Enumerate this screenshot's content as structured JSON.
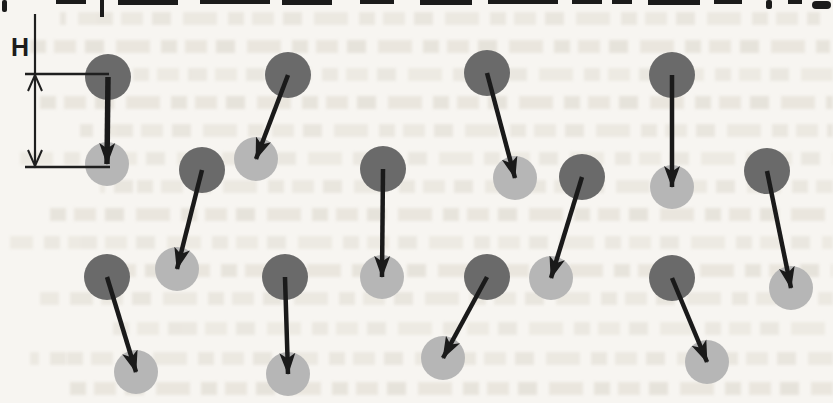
{
  "figure": {
    "label_h": "H",
    "colors": {
      "dark_particle": "#6a6a6a",
      "light_particle": "#b6b6b6",
      "arrow": "#1a1a1a",
      "line": "#1f1f1f",
      "background": "#f7f5f1"
    },
    "particle_radius_dark": 23,
    "particle_radius_light": 22,
    "dimension": {
      "x": 35,
      "line_top": 14,
      "y_top": 74,
      "y_bottom": 167,
      "tick_x1": 25,
      "tick_x2": 109
    },
    "pairs": [
      {
        "dark": [
          108,
          77
        ],
        "light": [
          107,
          164
        ],
        "thick": true
      },
      {
        "dark": [
          288,
          75
        ],
        "light": [
          256,
          159
        ]
      },
      {
        "dark": [
          487,
          73
        ],
        "light": [
          515,
          178
        ]
      },
      {
        "dark": [
          672,
          75
        ],
        "light": [
          672,
          187
        ]
      },
      {
        "dark": [
          202,
          170
        ],
        "light": [
          177,
          269
        ]
      },
      {
        "dark": [
          383,
          169
        ],
        "light": [
          382,
          277
        ]
      },
      {
        "dark": [
          582,
          177
        ],
        "light": [
          551,
          278
        ]
      },
      {
        "dark": [
          767,
          171
        ],
        "light": [
          791,
          288
        ]
      },
      {
        "dark": [
          107,
          277
        ],
        "light": [
          136,
          372
        ]
      },
      {
        "dark": [
          285,
          277
        ],
        "light": [
          288,
          374
        ]
      },
      {
        "dark": [
          487,
          277
        ],
        "light": [
          443,
          358
        ]
      },
      {
        "dark": [
          672,
          278
        ],
        "light": [
          707,
          362
        ]
      }
    ]
  }
}
